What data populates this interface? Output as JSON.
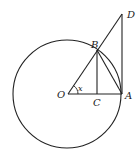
{
  "diagram": {
    "points": {
      "O": {
        "label": "O",
        "x": 68,
        "y": 94
      },
      "A": {
        "label": "A",
        "x": 122,
        "y": 94
      },
      "B": {
        "label": "B",
        "x": 97,
        "y": 50
      },
      "C": {
        "label": "C",
        "x": 97,
        "y": 94
      },
      "D": {
        "label": "D",
        "x": 122,
        "y": 14
      }
    },
    "circle": {
      "center": "O",
      "cx": 67,
      "cy": 94,
      "r": 55
    },
    "angle_label": "x",
    "segments": [
      "OA",
      "OD",
      "BC",
      "BA",
      "AD"
    ],
    "stroke_color": "#222222"
  }
}
